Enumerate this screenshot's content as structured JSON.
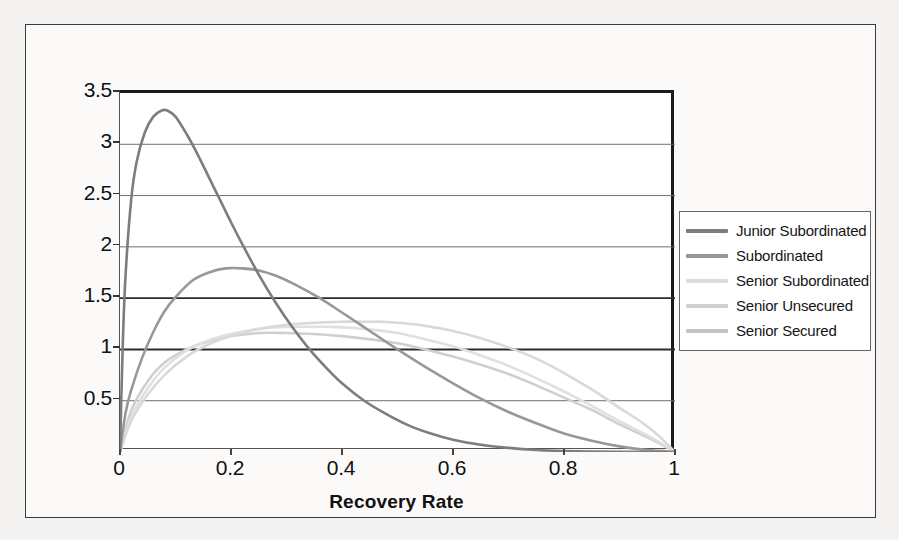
{
  "chart_data": {
    "type": "line",
    "title": "",
    "xlabel": "Recovery Rate",
    "ylabel": "",
    "xlim": [
      0,
      1
    ],
    "ylim": [
      0,
      3.5
    ],
    "x_ticks": [
      "0",
      "0.2",
      "0.4",
      "0.6",
      "0.8",
      "1"
    ],
    "x_tick_values": [
      0,
      0.2,
      0.4,
      0.6,
      0.8,
      1
    ],
    "y_ticks": [
      "0.5",
      "1",
      "1.5",
      "2",
      "2.5",
      "3",
      "3.5"
    ],
    "y_tick_values": [
      0.5,
      1,
      1.5,
      2,
      2.5,
      3,
      3.5
    ],
    "grid": "horizontal",
    "legend_position": "right",
    "series": [
      {
        "name": "Junior Subordinated",
        "color": "#7d7d7d",
        "peak_x": 0.085,
        "peak_y": 3.33,
        "x": [
          0.0,
          0.005,
          0.01,
          0.02,
          0.03,
          0.045,
          0.06,
          0.075,
          0.085,
          0.1,
          0.12,
          0.14,
          0.16,
          0.18,
          0.2,
          0.22,
          0.25,
          0.28,
          0.31,
          0.34,
          0.37,
          0.4,
          0.44,
          0.48,
          0.52,
          0.56,
          0.6,
          0.65,
          0.7,
          0.75,
          0.8,
          0.85,
          0.9,
          0.95,
          1.0
        ],
        "y": [
          0.0,
          1.05,
          1.72,
          2.45,
          2.83,
          3.12,
          3.27,
          3.33,
          3.33,
          3.27,
          3.1,
          2.9,
          2.68,
          2.46,
          2.24,
          2.03,
          1.73,
          1.46,
          1.22,
          1.01,
          0.83,
          0.67,
          0.5,
          0.37,
          0.26,
          0.18,
          0.12,
          0.07,
          0.04,
          0.02,
          0.01,
          0.005,
          0.002,
          0.0,
          0.0
        ]
      },
      {
        "name": "Subordinated",
        "color": "#989898",
        "peak_x": 0.22,
        "peak_y": 1.79,
        "x": [
          0.0,
          0.01,
          0.02,
          0.04,
          0.06,
          0.08,
          0.1,
          0.13,
          0.16,
          0.19,
          0.22,
          0.25,
          0.28,
          0.32,
          0.36,
          0.4,
          0.45,
          0.5,
          0.55,
          0.6,
          0.65,
          0.7,
          0.75,
          0.8,
          0.85,
          0.9,
          0.95,
          1.0
        ],
        "y": [
          0.0,
          0.38,
          0.6,
          0.92,
          1.17,
          1.37,
          1.51,
          1.67,
          1.75,
          1.79,
          1.79,
          1.77,
          1.72,
          1.62,
          1.5,
          1.36,
          1.18,
          1.0,
          0.83,
          0.67,
          0.52,
          0.39,
          0.28,
          0.18,
          0.11,
          0.055,
          0.018,
          0.0
        ]
      },
      {
        "name": "Senior Subordinated",
        "color": "#d9d9d9",
        "peak_x": 0.47,
        "peak_y": 1.27,
        "x": [
          0.0,
          0.02,
          0.05,
          0.08,
          0.12,
          0.16,
          0.2,
          0.25,
          0.3,
          0.35,
          0.4,
          0.45,
          0.47,
          0.5,
          0.55,
          0.6,
          0.65,
          0.7,
          0.75,
          0.8,
          0.85,
          0.9,
          0.94,
          0.97,
          1.0
        ],
        "y": [
          0.0,
          0.3,
          0.56,
          0.75,
          0.93,
          1.05,
          1.13,
          1.2,
          1.24,
          1.26,
          1.27,
          1.27,
          1.27,
          1.26,
          1.23,
          1.18,
          1.11,
          1.02,
          0.91,
          0.77,
          0.61,
          0.43,
          0.29,
          0.16,
          0.0
        ]
      },
      {
        "name": "Senior Unsecured",
        "color": "#e0e0e0",
        "peak_x": 0.38,
        "peak_y": 1.22,
        "x": [
          0.0,
          0.02,
          0.05,
          0.08,
          0.12,
          0.16,
          0.2,
          0.25,
          0.3,
          0.35,
          0.38,
          0.42,
          0.46,
          0.5,
          0.55,
          0.6,
          0.65,
          0.7,
          0.75,
          0.8,
          0.85,
          0.9,
          0.94,
          0.97,
          1.0
        ],
        "y": [
          0.0,
          0.34,
          0.62,
          0.82,
          0.99,
          1.09,
          1.15,
          1.2,
          1.22,
          1.22,
          1.22,
          1.21,
          1.19,
          1.16,
          1.1,
          1.03,
          0.94,
          0.84,
          0.72,
          0.59,
          0.45,
          0.3,
          0.19,
          0.1,
          0.0
        ]
      },
      {
        "name": "Senior Secured",
        "color": "#cfcfcf",
        "peak_x": 0.3,
        "peak_y": 1.16,
        "x": [
          0.0,
          0.02,
          0.05,
          0.08,
          0.12,
          0.16,
          0.2,
          0.25,
          0.3,
          0.35,
          0.4,
          0.45,
          0.5,
          0.55,
          0.6,
          0.65,
          0.7,
          0.75,
          0.8,
          0.85,
          0.9,
          0.94,
          0.97,
          1.0
        ],
        "y": [
          0.0,
          0.4,
          0.69,
          0.87,
          1.0,
          1.08,
          1.13,
          1.16,
          1.16,
          1.15,
          1.13,
          1.1,
          1.06,
          1.0,
          0.93,
          0.85,
          0.76,
          0.65,
          0.53,
          0.41,
          0.27,
          0.17,
          0.09,
          0.0
        ]
      }
    ]
  },
  "legend": {
    "items": [
      {
        "label": "Junior Subordinated",
        "color": "#7d7d7d"
      },
      {
        "label": "Subordinated",
        "color": "#989898"
      },
      {
        "label": "Senior Subordinated",
        "color": "#dcdcdc"
      },
      {
        "label": "Senior Unsecured",
        "color": "#cfcfcf"
      },
      {
        "label": "Senior Secured",
        "color": "#c4c4c4"
      }
    ]
  },
  "axes": {
    "x_title": "Recovery Rate",
    "y_ticks": [
      "3.5",
      "3",
      "2.5",
      "2",
      "1.5",
      "1",
      "0.5"
    ],
    "x_ticks": [
      "0",
      "0.2",
      "0.4",
      "0.6",
      "0.8",
      "1"
    ]
  },
  "colors": {
    "page_background": "#f4f3f1",
    "figure_background": "#fbfaf9",
    "frame": "#3a3a3a",
    "axis": "#1a1a1a",
    "gridline": "#6f6f6f",
    "gridline_bold": "#2b2b2b",
    "text": "#111111"
  }
}
